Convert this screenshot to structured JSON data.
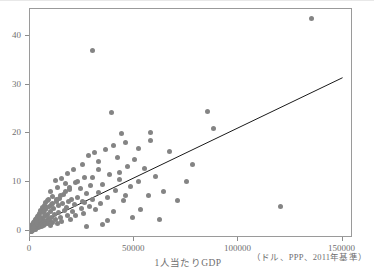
{
  "chart_data": {
    "type": "scatter",
    "title": "",
    "xlabel": "1人当たりGDP",
    "xlabel_note": "（ドル、PPP、2011年基準）",
    "ylabel": "",
    "xlim": [
      0,
      155000
    ],
    "ylim": [
      -1.5,
      45.5
    ],
    "xticks": [
      0,
      50000,
      100000,
      150000
    ],
    "xtick_labels": [
      "0",
      "50000",
      "100000",
      "150000"
    ],
    "yticks": [
      0,
      10,
      20,
      30,
      40
    ],
    "ytick_labels": [
      "0",
      "10",
      "20",
      "30",
      "40"
    ],
    "grid": false,
    "legend": null,
    "marker_color": "#848484",
    "marker_size": 5,
    "frame_color": "#9a9a9a",
    "text_color": "#6f6f6f",
    "series": [
      {
        "name": "countries",
        "points": [
          [
            135000,
            43.5
          ],
          [
            30000,
            37.0
          ],
          [
            39000,
            24.2
          ],
          [
            85000,
            24.4
          ],
          [
            44000,
            20.0
          ],
          [
            58000,
            20.2
          ],
          [
            88000,
            20.9
          ],
          [
            46000,
            18.0
          ],
          [
            40000,
            17.4
          ],
          [
            36000,
            16.6
          ],
          [
            31000,
            16.0
          ],
          [
            28000,
            15.5
          ],
          [
            42000,
            15.1
          ],
          [
            50000,
            14.6
          ],
          [
            33000,
            14.2
          ],
          [
            25000,
            13.6
          ],
          [
            47000,
            13.1
          ],
          [
            55000,
            12.8
          ],
          [
            21000,
            12.6
          ],
          [
            18000,
            11.8
          ],
          [
            38000,
            11.5
          ],
          [
            60000,
            11.2
          ],
          [
            26000,
            11.0
          ],
          [
            15000,
            10.8
          ],
          [
            43000,
            10.5
          ],
          [
            12000,
            10.3
          ],
          [
            52000,
            10.0
          ],
          [
            22000,
            9.8
          ],
          [
            17000,
            9.6
          ],
          [
            35000,
            9.4
          ],
          [
            29000,
            9.2
          ],
          [
            48000,
            9.0
          ],
          [
            13000,
            8.8
          ],
          [
            24000,
            8.6
          ],
          [
            19000,
            8.4
          ],
          [
            41000,
            8.2
          ],
          [
            10000,
            8.0
          ],
          [
            33000,
            7.8
          ],
          [
            27000,
            7.6
          ],
          [
            16000,
            7.4
          ],
          [
            57000,
            7.2
          ],
          [
            11000,
            7.0
          ],
          [
            23000,
            6.9
          ],
          [
            37000,
            6.8
          ],
          [
            14000,
            6.6
          ],
          [
            20000,
            6.5
          ],
          [
            9000,
            6.4
          ],
          [
            30000,
            6.3
          ],
          [
            45000,
            6.2
          ],
          [
            8500,
            6.1
          ],
          [
            12500,
            6.0
          ],
          [
            18500,
            5.9
          ],
          [
            26000,
            5.8
          ],
          [
            7500,
            5.7
          ],
          [
            15500,
            5.6
          ],
          [
            34000,
            5.5
          ],
          [
            10500,
            5.4
          ],
          [
            21500,
            5.3
          ],
          [
            6800,
            5.2
          ],
          [
            13500,
            5.1
          ],
          [
            28500,
            5.0
          ],
          [
            9200,
            4.9
          ],
          [
            17500,
            4.8
          ],
          [
            5900,
            4.7
          ],
          [
            24500,
            4.6
          ],
          [
            11500,
            4.5
          ],
          [
            7200,
            4.4
          ],
          [
            31500,
            4.3
          ],
          [
            16500,
            4.2
          ],
          [
            5200,
            4.1
          ],
          [
            9800,
            4.0
          ],
          [
            20500,
            3.9
          ],
          [
            6300,
            3.8
          ],
          [
            13800,
            3.7
          ],
          [
            4600,
            3.6
          ],
          [
            25500,
            3.5
          ],
          [
            8200,
            3.4
          ],
          [
            11800,
            3.3
          ],
          [
            4100,
            3.2
          ],
          [
            17800,
            3.1
          ],
          [
            6900,
            3.0
          ],
          [
            3600,
            2.9
          ],
          [
            10200,
            2.8
          ],
          [
            14800,
            2.7
          ],
          [
            5500,
            2.6
          ],
          [
            3200,
            2.5
          ],
          [
            8800,
            2.4
          ],
          [
            19500,
            2.35
          ],
          [
            4800,
            2.3
          ],
          [
            2800,
            2.25
          ],
          [
            12200,
            2.2
          ],
          [
            6600,
            2.15
          ],
          [
            3900,
            2.1
          ],
          [
            2400,
            2.05
          ],
          [
            9500,
            2.0
          ],
          [
            15200,
            1.95
          ],
          [
            5100,
            1.9
          ],
          [
            2100,
            1.85
          ],
          [
            7400,
            1.8
          ],
          [
            3400,
            1.75
          ],
          [
            11000,
            1.7
          ],
          [
            1850,
            1.65
          ],
          [
            4400,
            1.6
          ],
          [
            6100,
            1.55
          ],
          [
            2600,
            1.5
          ],
          [
            1600,
            1.45
          ],
          [
            8600,
            1.42
          ],
          [
            3100,
            1.4
          ],
          [
            13200,
            1.38
          ],
          [
            5300,
            1.35
          ],
          [
            1400,
            1.3
          ],
          [
            2300,
            1.28
          ],
          [
            7000,
            1.25
          ],
          [
            3800,
            1.2
          ],
          [
            1200,
            1.18
          ],
          [
            4900,
            1.15
          ],
          [
            1900,
            1.1
          ],
          [
            9900,
            1.08
          ],
          [
            2900,
            1.05
          ],
          [
            1050,
            1.0
          ],
          [
            6400,
            0.98
          ],
          [
            1600,
            0.95
          ],
          [
            3500,
            0.92
          ],
          [
            900,
            0.9
          ],
          [
            2200,
            0.88
          ],
          [
            4500,
            0.85
          ],
          [
            1300,
            0.82
          ],
          [
            780,
            0.8
          ],
          [
            2700,
            0.78
          ],
          [
            5700,
            0.76
          ],
          [
            1000,
            0.74
          ],
          [
            680,
            0.72
          ],
          [
            3300,
            0.7
          ],
          [
            1750,
            0.68
          ],
          [
            580,
            0.66
          ],
          [
            2500,
            0.64
          ],
          [
            4200,
            0.62
          ],
          [
            1150,
            0.6
          ],
          [
            500,
            0.58
          ],
          [
            3000,
            0.56
          ],
          [
            1900,
            0.54
          ],
          [
            430,
            0.52
          ],
          [
            820,
            0.5
          ],
          [
            2600,
            0.48
          ],
          [
            1450,
            0.46
          ],
          [
            370,
            0.45
          ],
          [
            640,
            0.43
          ],
          [
            2150,
            0.41
          ],
          [
            1100,
            0.4
          ],
          [
            320,
            0.38
          ],
          [
            1700,
            0.36
          ],
          [
            520,
            0.35
          ],
          [
            890,
            0.33
          ],
          [
            2800,
            0.32
          ],
          [
            280,
            0.3
          ],
          [
            1350,
            0.29
          ],
          [
            430,
            0.27
          ],
          [
            720,
            0.26
          ],
          [
            1950,
            0.25
          ],
          [
            240,
            0.23
          ],
          [
            1050,
            0.22
          ],
          [
            350,
            0.2
          ],
          [
            600,
            0.19
          ],
          [
            1500,
            0.18
          ],
          [
            200,
            0.16
          ],
          [
            850,
            0.15
          ],
          [
            290,
            0.14
          ],
          [
            480,
            0.12
          ],
          [
            1200,
            0.11
          ],
          [
            160,
            0.1
          ],
          [
            700,
            0.09
          ],
          [
            240,
            0.08
          ],
          [
            390,
            0.06
          ],
          [
            950,
            0.05
          ],
          [
            130,
            0.04
          ],
          [
            560,
            0.03
          ],
          [
            190,
            0.02
          ],
          [
            310,
            0.01
          ],
          [
            800,
            0.0
          ],
          [
            100,
            0.0
          ],
          [
            450,
            -0.02
          ],
          [
            150,
            -0.03
          ],
          [
            250,
            -0.05
          ],
          [
            620,
            -0.06
          ],
          [
            80,
            -0.07
          ],
          [
            350,
            -0.08
          ],
          [
            120,
            -0.09
          ],
          [
            210,
            -0.1
          ],
          [
            500,
            -0.12
          ],
          [
            1750,
            0.6
          ],
          [
            2950,
            1.85
          ],
          [
            4700,
            2.95
          ],
          [
            6700,
            3.95
          ],
          [
            8100,
            4.85
          ],
          [
            10800,
            5.65
          ],
          [
            12800,
            6.45
          ],
          [
            14500,
            7.15
          ],
          [
            16800,
            8.05
          ],
          [
            19000,
            8.85
          ],
          [
            23000,
            10.1
          ],
          [
            120000,
            5.0
          ],
          [
            64000,
            8.0
          ],
          [
            71000,
            6.1
          ],
          [
            78000,
            13.5
          ],
          [
            53000,
            4.3
          ],
          [
            67000,
            16.2
          ],
          [
            49000,
            2.8
          ],
          [
            62000,
            2.2
          ],
          [
            35000,
            1.3
          ],
          [
            27000,
            0.9
          ],
          [
            43000,
            12.0
          ],
          [
            58000,
            18.5
          ],
          [
            75000,
            10.0
          ],
          [
            33000,
            12.5
          ],
          [
            25000,
            6.0
          ],
          [
            22000,
            3.2
          ],
          [
            30000,
            11.0
          ],
          [
            46000,
            7.3
          ],
          [
            40000,
            4.0
          ],
          [
            52000,
            16.8
          ],
          [
            37000,
            2.0
          ]
        ]
      }
    ],
    "trendline": {
      "x0": 0,
      "y0": 0.6,
      "x1": 150000,
      "y1": 31.4,
      "color": "#1a1a1a"
    }
  }
}
